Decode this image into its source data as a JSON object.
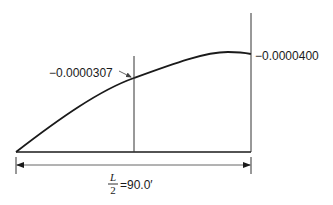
{
  "diagram": {
    "title": "",
    "curve_description": "Deflection curve from support to midspan",
    "labels": {
      "quarter_point_value": "−0.0000307",
      "midspan_value": "−0.0000400",
      "span_numerator": "L",
      "span_denominator": "2",
      "span_value": "=90.0′"
    },
    "values": {
      "half_span_ft": 90.0,
      "quarter_point_deflection": -3.07e-05,
      "midspan_deflection": -4e-05
    },
    "colors": {
      "line": "#1a1a1a",
      "background": "#ffffff"
    }
  }
}
